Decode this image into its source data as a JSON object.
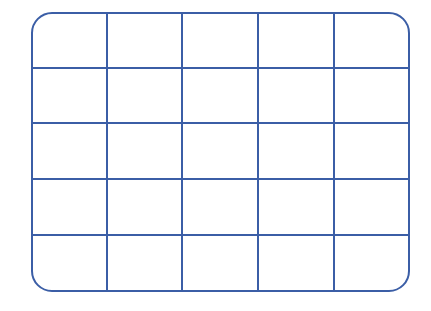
{
  "diagram": {
    "type": "grid",
    "rows": 5,
    "columns": 5,
    "border_color": "#3b5ea6",
    "background": "#ffffff",
    "line_width": 2,
    "corner_radius": 20,
    "frame": {
      "left": 32,
      "top": 13,
      "right": 409,
      "bottom": 291
    },
    "column_lines_x": [
      107,
      182,
      258,
      334
    ],
    "row_lines_y": [
      68,
      123,
      179,
      235
    ]
  }
}
